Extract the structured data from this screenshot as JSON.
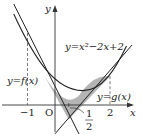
{
  "diagram": {
    "type": "function-graph",
    "axes": {
      "x_label": "x",
      "y_label": "y",
      "origin_label": "O"
    },
    "ticks": {
      "x_neg1": "−1",
      "x_2": "2",
      "half_num": "1",
      "half_den": "2"
    },
    "curves": [
      {
        "name": "parabola",
        "label": "y=x²−2x+2"
      },
      {
        "name": "tangent-f",
        "label": "y=f(x)"
      },
      {
        "name": "tangent-g",
        "label": "y=g(x)"
      }
    ],
    "shaded_region": "area between parabola and the two tangent lines",
    "colors": {
      "line": "#222222",
      "shade": "#b4b4b4",
      "axis": "#333333"
    }
  }
}
